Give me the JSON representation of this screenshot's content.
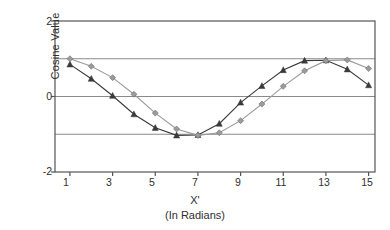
{
  "chart_data": {
    "type": "line",
    "title": "",
    "xlabel": "X'",
    "xlabel_sub": "(In Radians)",
    "ylabel": "Cosine Value",
    "xlim": [
      0.3,
      15.3
    ],
    "ylim": [
      -2,
      2
    ],
    "xticks": [
      1,
      3,
      5,
      7,
      9,
      11,
      13,
      15
    ],
    "yticks": [
      2,
      0,
      -2
    ],
    "gridlines_y": [
      1,
      0,
      -1
    ],
    "grid": true,
    "legend": "none",
    "x": [
      1,
      2,
      3,
      4,
      5,
      6,
      7,
      8,
      9,
      10,
      11,
      12,
      13,
      14,
      15
    ],
    "series": [
      {
        "name": "Series 1",
        "marker": "triangle",
        "color": "#3a3a3a",
        "values": [
          0.85,
          0.47,
          0.02,
          -0.47,
          -0.83,
          -1.03,
          -1.02,
          -0.72,
          -0.16,
          0.28,
          0.7,
          0.95,
          0.96,
          0.72,
          0.3
        ]
      },
      {
        "name": "Series 2",
        "marker": "diamond",
        "color": "#9b9b9b",
        "values": [
          1.0,
          0.8,
          0.5,
          0.06,
          -0.44,
          -0.86,
          -1.03,
          -0.96,
          -0.64,
          -0.2,
          0.27,
          0.68,
          0.95,
          0.97,
          0.74
        ]
      }
    ]
  },
  "axis": {
    "y_labels": [
      "2",
      "0",
      "-2"
    ],
    "x_labels": [
      "1",
      "3",
      "5",
      "7",
      "9",
      "11",
      "13",
      "15"
    ],
    "y_title": "Cosine Value",
    "x_title": "X'",
    "x_subtitle": "(In Radians)"
  },
  "colors": {
    "series_dark": "#3a3a3a",
    "series_light": "#9b9b9b",
    "gridline": "#8a8a8a",
    "frame": "#555555",
    "background": "#ffffff"
  }
}
